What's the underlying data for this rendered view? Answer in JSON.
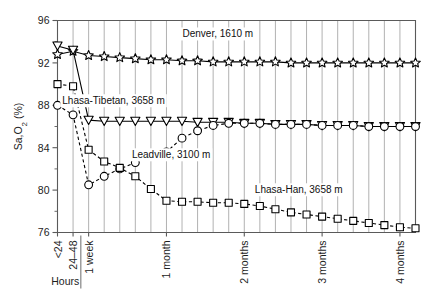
{
  "chart_data": {
    "type": "line",
    "title": "",
    "xlabel": "",
    "ylabel": "Sa,O2 (%)",
    "ylabel_parts": {
      "main": "Sa",
      "sub1": ",O",
      "sub2": "2",
      "unit": " (%)"
    },
    "ylim": [
      76,
      96
    ],
    "yticks": [
      76,
      80,
      84,
      88,
      92,
      96
    ],
    "yticks_minor": [
      78,
      82,
      86,
      90,
      94
    ],
    "grid": true,
    "grid_axis": "x",
    "legend_position": "inline-annotations",
    "x_group_label": "Hours",
    "x_index_range": [
      0,
      23
    ],
    "xticks": [
      {
        "index": 0,
        "label": "<24"
      },
      {
        "index": 1,
        "label": "24–48"
      },
      {
        "index": 2,
        "label": "1 week"
      },
      {
        "index": 7,
        "label": "1 month"
      },
      {
        "index": 12,
        "label": "2 months"
      },
      {
        "index": 17,
        "label": "3 months"
      },
      {
        "index": 22,
        "label": "4 months"
      }
    ],
    "gridline_indices": [
      0,
      1,
      2,
      3,
      4,
      5,
      6,
      7,
      8,
      9,
      10,
      11,
      12,
      13,
      14,
      15,
      16,
      17,
      18,
      19,
      20,
      21,
      22
    ],
    "series": [
      {
        "name": "Denver, 1610 m",
        "marker": "star",
        "linestyle": "solid",
        "label": "Denver, 1610 m",
        "label_x_index": 10.3,
        "label_y": 94.4,
        "x": [
          0,
          1,
          2,
          3,
          4,
          5,
          6,
          7,
          8,
          9,
          10,
          11,
          12,
          13,
          14,
          15,
          16,
          17,
          18,
          19,
          20,
          21,
          22,
          23
        ],
        "values": [
          92.8,
          93.1,
          92.7,
          92.6,
          92.5,
          92.4,
          92.3,
          92.3,
          92.2,
          92.2,
          92.1,
          92.1,
          92.1,
          92.1,
          92.1,
          92.0,
          92.0,
          92.0,
          92.0,
          92.0,
          92.0,
          92.0,
          92.0,
          92.0
        ]
      },
      {
        "name": "Lhasa-Tibetan, 3658 m",
        "marker": "triangle-down",
        "linestyle": "solid",
        "label": "Lhasa-Tibetan, 3658 m",
        "label_x_index": 3.6,
        "label_y": 88.1,
        "x": [
          0,
          1,
          2,
          3,
          4,
          5,
          6,
          7,
          8,
          9,
          10,
          11,
          12,
          13,
          14,
          15,
          16,
          17,
          18,
          19,
          20,
          21,
          22,
          23
        ],
        "values": [
          93.6,
          93.2,
          86.6,
          86.5,
          86.5,
          86.5,
          86.5,
          86.5,
          86.5,
          86.4,
          86.4,
          86.4,
          86.3,
          86.3,
          86.2,
          86.2,
          86.2,
          86.1,
          86.1,
          86.1,
          86.0,
          86.0,
          86.0,
          86.0
        ]
      },
      {
        "name": "Leadville, 3100 m",
        "marker": "circle",
        "linestyle": "dashed",
        "label": "Leadville, 3100 m",
        "label_x_index": 7.3,
        "label_y": 83.0,
        "x": [
          0,
          1,
          2,
          3,
          4,
          5,
          6,
          7,
          8,
          9,
          10,
          11,
          12,
          13,
          14,
          15,
          16,
          17,
          18,
          19,
          20,
          21,
          22,
          23
        ],
        "values": [
          88.0,
          87.1,
          80.5,
          81.3,
          82.0,
          82.6,
          83.4,
          83.6,
          84.9,
          85.6,
          86.1,
          86.3,
          86.3,
          86.3,
          86.2,
          86.2,
          86.2,
          86.1,
          86.1,
          86.1,
          86.0,
          86.0,
          86.0,
          86.0
        ]
      },
      {
        "name": "Lhasa-Han, 3658 m",
        "marker": "square",
        "linestyle": "dashed",
        "label": "Lhasa-Han, 3658 m",
        "label_x_index": 15.5,
        "label_y": 79.7,
        "x": [
          0,
          1,
          2,
          3,
          4,
          5,
          6,
          7,
          8,
          9,
          10,
          11,
          12,
          13,
          14,
          15,
          16,
          17,
          18,
          19,
          20,
          21,
          22,
          23
        ],
        "values": [
          90.0,
          89.8,
          83.8,
          82.7,
          82.1,
          81.3,
          80.1,
          79.0,
          78.9,
          78.9,
          78.8,
          78.8,
          78.7,
          78.5,
          78.2,
          77.9,
          77.7,
          77.5,
          77.3,
          77.1,
          76.9,
          76.7,
          76.5,
          76.4
        ]
      }
    ]
  }
}
